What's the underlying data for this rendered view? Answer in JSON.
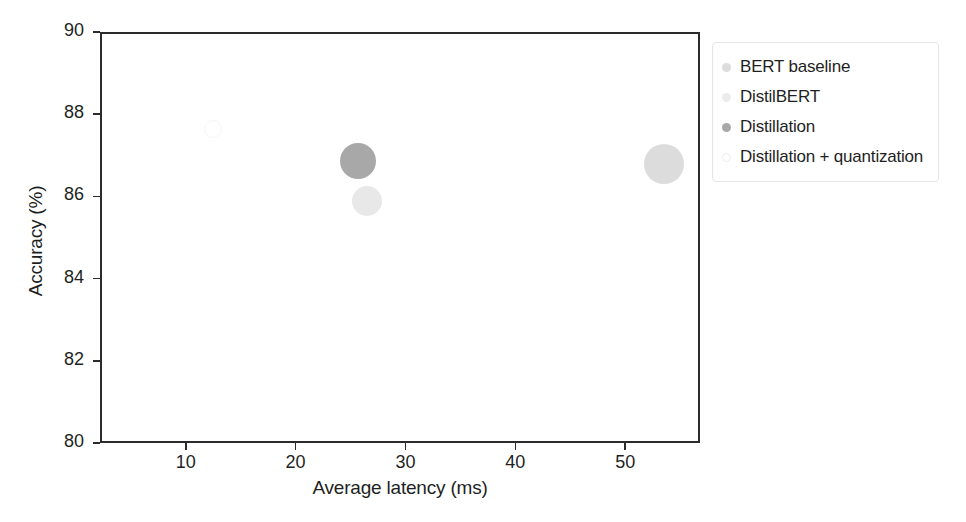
{
  "chart_data": {
    "type": "scatter",
    "title": "",
    "xlabel": "Average latency (ms)",
    "ylabel": "Accuracy (%)",
    "xlim": [
      2.2,
      56.8
    ],
    "ylim": [
      80,
      90
    ],
    "xticks": [
      10,
      20,
      30,
      40,
      50
    ],
    "yticks": [
      80,
      82,
      84,
      86,
      88,
      90
    ],
    "xtick_labels": [
      "10",
      "20",
      "30",
      "40",
      "50"
    ],
    "ytick_labels": [
      "80",
      "82",
      "84",
      "86",
      "88",
      "90"
    ],
    "grid": false,
    "legend_position": "outside right top",
    "bubble_size_encodes": "model size",
    "points": [
      {
        "name": "BERT baseline",
        "x": 53.5,
        "y": 86.8,
        "radius_px": 20,
        "color": "#dcdcdc",
        "filled": true
      },
      {
        "name": "DistilBERT",
        "x": 26.5,
        "y": 85.9,
        "radius_px": 15,
        "color": "#e8e8e8",
        "filled": true
      },
      {
        "name": "Distillation",
        "x": 25.7,
        "y": 86.85,
        "radius_px": 18,
        "color": "#a8a8a8",
        "filled": true
      },
      {
        "name": "Distillation + quantization",
        "x": 12.5,
        "y": 87.65,
        "radius_px": 9,
        "color": "#f7f7f7",
        "filled": false
      }
    ]
  },
  "legend": {
    "entries": [
      {
        "label": "BERT baseline",
        "color": "#dcdcdc",
        "filled": true
      },
      {
        "label": "DistilBERT",
        "color": "#ececec",
        "filled": true
      },
      {
        "label": "Distillation",
        "color": "#a8a8a8",
        "filled": true
      },
      {
        "label": "Distillation + quantization",
        "color": "#fafafa",
        "filled": false
      }
    ]
  },
  "colors": {
    "axis": "#2b2b2b",
    "text": "#1f1f1f",
    "legend_border": "#e6e6e6",
    "background": "#ffffff"
  }
}
